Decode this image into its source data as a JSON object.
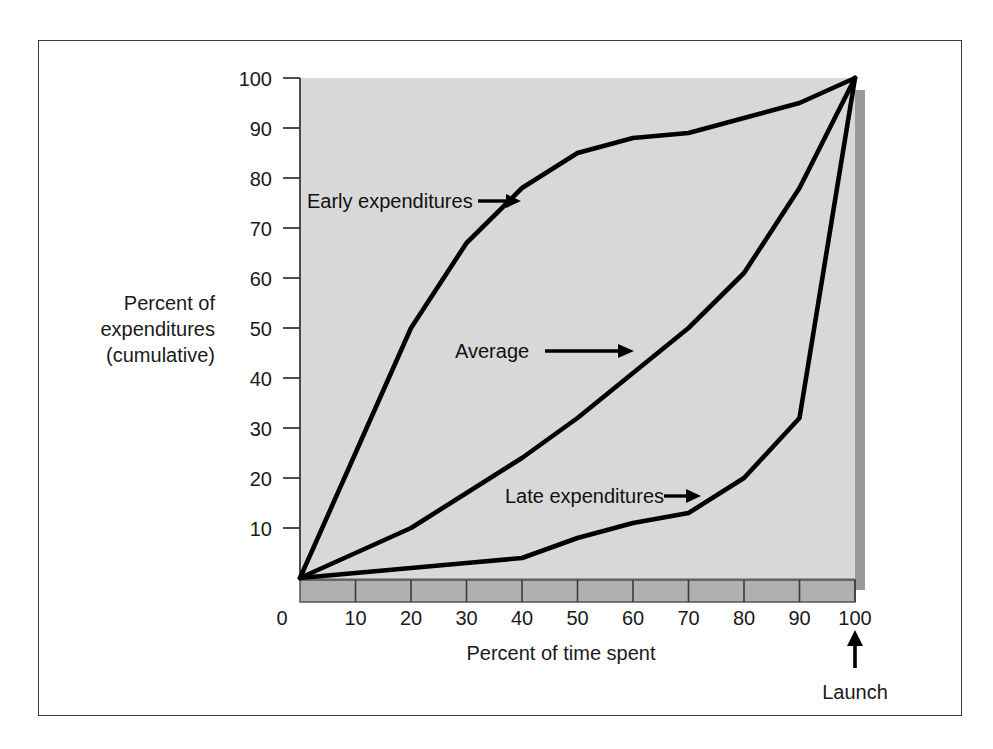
{
  "figure": {
    "background_color": "#ffffff",
    "frame_color": "#3a3a3a",
    "plot_background_color": "#d8d8d8",
    "plot_shadow_color": "#9a9a9a",
    "axis_bar_color": "#b0b0b0",
    "line_color": "#000000"
  },
  "axes": {
    "y_title_lines": [
      "Percent of",
      "expenditures",
      "(cumulative)"
    ],
    "x_title": "Percent of time spent",
    "y_ticks": [
      "10",
      "20",
      "30",
      "40",
      "50",
      "60",
      "70",
      "80",
      "90",
      "100"
    ],
    "x_ticks": [
      "0",
      "10",
      "20",
      "30",
      "40",
      "50",
      "60",
      "70",
      "80",
      "90",
      "100"
    ]
  },
  "annotations": {
    "launch_label": "Launch"
  },
  "chart_data": {
    "type": "line",
    "title": "",
    "subtitle": "",
    "xlabel": "Percent of time spent",
    "ylabel": "Percent of expenditures (cumulative)",
    "xlim": [
      0,
      100
    ],
    "ylim": [
      0,
      100
    ],
    "grid": false,
    "legend_position": "inline-annotations",
    "annotations": [
      {
        "text": "Early expenditures",
        "points_to_x": 34,
        "points_to_y": 75,
        "arrow": "right"
      },
      {
        "text": "Average",
        "points_to_x": 58,
        "points_to_y": 45,
        "arrow": "right"
      },
      {
        "text": "Late expenditures",
        "points_to_x": 71,
        "points_to_y": 16,
        "arrow": "right"
      },
      {
        "text": "Launch",
        "points_to_x": 100,
        "points_to_y": 0,
        "arrow": "up"
      }
    ],
    "series": [
      {
        "name": "Early expenditures",
        "x": [
          0,
          10,
          20,
          30,
          40,
          50,
          60,
          70,
          80,
          90,
          100
        ],
        "values": [
          0,
          25,
          50,
          67,
          78,
          85,
          88,
          89,
          92,
          95,
          100
        ]
      },
      {
        "name": "Average",
        "x": [
          0,
          10,
          20,
          30,
          40,
          50,
          60,
          70,
          80,
          90,
          100
        ],
        "values": [
          0,
          5,
          10,
          17,
          24,
          32,
          41,
          50,
          61,
          78,
          100
        ]
      },
      {
        "name": "Late expenditures",
        "x": [
          0,
          10,
          20,
          30,
          40,
          50,
          60,
          70,
          80,
          90,
          100
        ],
        "values": [
          0,
          1,
          2,
          3,
          4,
          8,
          11,
          13,
          20,
          32,
          100
        ]
      }
    ]
  }
}
